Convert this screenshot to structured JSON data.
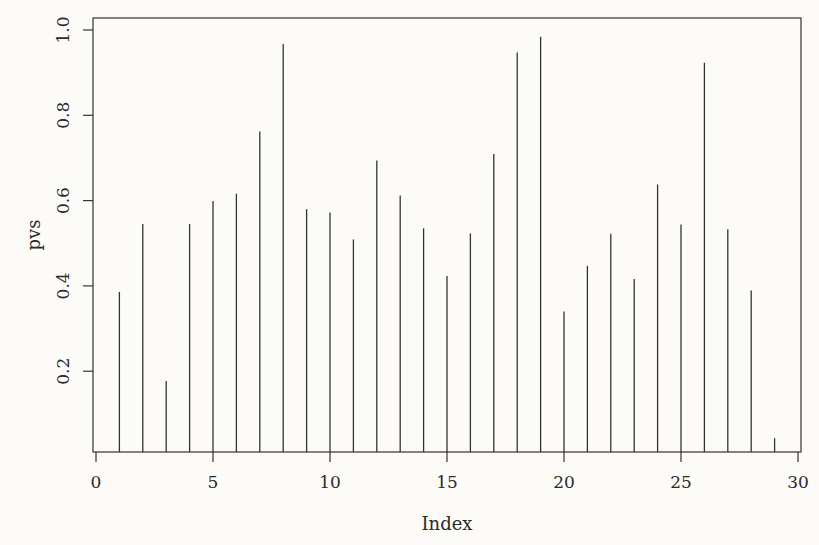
{
  "chart_data": {
    "type": "bar",
    "subtype": "spike (R plot type='h')",
    "title": "",
    "xlabel": "Index",
    "ylabel": "pvs",
    "x": [
      1,
      2,
      3,
      4,
      5,
      6,
      7,
      8,
      9,
      10,
      11,
      12,
      13,
      14,
      15,
      16,
      17,
      18,
      19,
      20,
      21,
      22,
      23,
      24,
      25,
      26,
      27,
      28,
      29
    ],
    "values": [
      0.386,
      0.545,
      0.177,
      0.545,
      0.599,
      0.616,
      0.762,
      0.967,
      0.58,
      0.572,
      0.509,
      0.694,
      0.612,
      0.535,
      0.423,
      0.523,
      0.709,
      0.947,
      0.984,
      0.34,
      0.447,
      0.522,
      0.416,
      0.638,
      0.544,
      0.923,
      0.533,
      0.389,
      0.043
    ],
    "xlim": [
      -0.1,
      30.1
    ],
    "ylim": [
      0.01,
      1.028
    ],
    "x_ticks": [
      0,
      5,
      10,
      15,
      20,
      25,
      30
    ],
    "x_tick_labels": [
      "0",
      "5",
      "10",
      "15",
      "20",
      "25",
      "30"
    ],
    "y_ticks": [
      0.2,
      0.4,
      0.6,
      0.8,
      1.0
    ],
    "y_tick_labels": [
      "0.2",
      "0.4",
      "0.6",
      "0.8",
      "1.0"
    ],
    "grid": false,
    "legend": null
  },
  "colors": {
    "background": "#fcfbf7",
    "line": "#333333",
    "text": "#2a2a2a"
  },
  "layout": {
    "plot_left": 93,
    "plot_right": 801,
    "plot_top": 18,
    "plot_bottom": 452,
    "x0_px": 96,
    "x30_px": 798,
    "y1_px": 30,
    "px_per_unit_y": 426.5
  }
}
